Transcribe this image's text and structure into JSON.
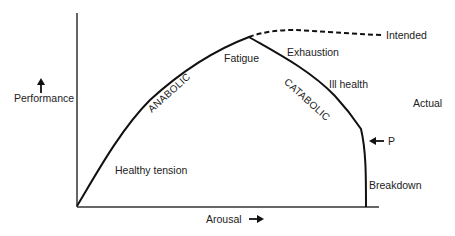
{
  "diagram": {
    "type": "performance-arousal curve",
    "axes": {
      "y_label": "Performance",
      "x_label": "Arousal",
      "y_arrow": "up-arrow",
      "x_arrow": "right-arrow"
    },
    "curves": {
      "intended": "Intended",
      "actual": "Actual"
    },
    "regions": {
      "anabolic": "ANABOLIC",
      "catabolic": "CATABOLIC"
    },
    "labels": {
      "healthy_tension": "Healthy tension",
      "fatigue": "Fatigue",
      "exhaustion": "Exhaustion",
      "ill_health": "Ill health",
      "breakdown": "Breakdown",
      "p_marker": "P"
    },
    "colors": {
      "line": "#111111",
      "text": "#222222"
    }
  }
}
